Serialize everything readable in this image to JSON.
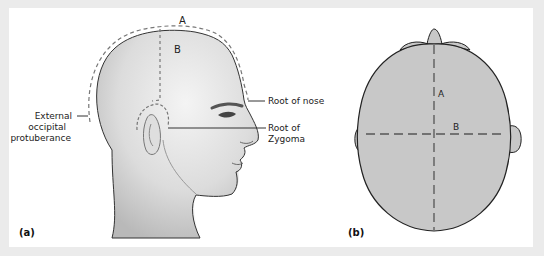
{
  "figure": {
    "panel_a": {
      "label": "(a)",
      "measure_labels": {
        "circumference": "A",
        "vertical": "B"
      },
      "annotations": {
        "root_of_nose": "Root of nose",
        "root_of_zygoma_line1": "Root of",
        "root_of_zygoma_line2": "Zygoma",
        "occipital_line1": "External",
        "occipital_line2": "occipital",
        "occipital_line3": "protuberance"
      }
    },
    "panel_b": {
      "label": "(b)",
      "measure_labels": {
        "anteroposterior": "A",
        "biauricular": "B"
      }
    },
    "colors": {
      "frame": "#ebebeb",
      "background": "#ffffff",
      "skull_fill": "#c8c8c8",
      "outline": "#222222",
      "dashed": "#777777"
    }
  }
}
